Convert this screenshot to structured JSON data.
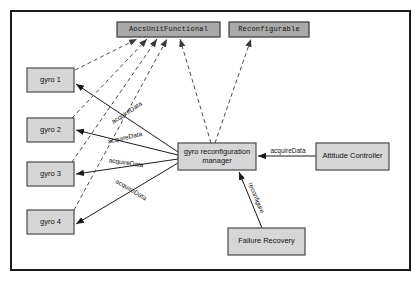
{
  "diagram": {
    "canvas": {
      "width": 419,
      "height": 281
    },
    "frame": {
      "x": 11,
      "y": 11,
      "width": 399,
      "height": 259
    },
    "colors": {
      "background": "#ffffff",
      "frame_stroke": "#1a1a1a",
      "node_fill": "#d6d6d6",
      "node_stroke": "#4a4a4a",
      "interface_fill": "#a9a9a9",
      "interface_stroke": "#3a3a3a",
      "edge_solid": "#1a1a1a",
      "edge_dashed": "#4a4a4a",
      "text": "#111111"
    },
    "nodes": [
      {
        "id": "aocs_unit_functional",
        "label": "AocsUnitFunctional",
        "kind": "interface",
        "x": 117,
        "y": 22,
        "width": 103,
        "height": 15
      },
      {
        "id": "reconfigurable",
        "label": "Reconfigurable",
        "kind": "interface",
        "x": 229,
        "y": 22,
        "width": 80,
        "height": 15
      },
      {
        "id": "gyro_1",
        "label": "gyro 1",
        "kind": "component",
        "x": 27,
        "y": 68,
        "width": 47,
        "height": 24
      },
      {
        "id": "gyro_2",
        "label": "gyro 2",
        "kind": "component",
        "x": 27,
        "y": 118,
        "width": 47,
        "height": 24
      },
      {
        "id": "gyro_3",
        "label": "gyro 3",
        "kind": "component",
        "x": 27,
        "y": 162,
        "width": 47,
        "height": 24
      },
      {
        "id": "gyro_4",
        "label": "gyro 4",
        "kind": "component",
        "x": 27,
        "y": 210,
        "width": 47,
        "height": 24
      },
      {
        "id": "gyro_reconfiguration_manager",
        "label": "gyro reconfiguration manager",
        "label_lines": [
          "gyro reconfiguration",
          "manager"
        ],
        "kind": "component",
        "x": 178,
        "y": 143,
        "width": 78,
        "height": 27
      },
      {
        "id": "attitude_controller",
        "label": "Attitude Controller",
        "kind": "component",
        "x": 316,
        "y": 143,
        "width": 73,
        "height": 27
      },
      {
        "id": "failure_recovery",
        "label": "Failure Recovery",
        "kind": "component",
        "x": 228,
        "y": 228,
        "width": 77,
        "height": 27
      }
    ],
    "edges": [
      {
        "id": "mgr_to_gyro1",
        "from": "gyro_reconfiguration_manager",
        "to": "gyro_1",
        "style": "solid",
        "label": "acquireData",
        "x1": 178,
        "y1": 152,
        "x2": 76,
        "y2": 84,
        "label_x": 127,
        "label_y": 113,
        "label_angle": -33
      },
      {
        "id": "mgr_to_gyro2",
        "from": "gyro_reconfiguration_manager",
        "to": "gyro_2",
        "style": "solid",
        "label": "acquireData",
        "x1": 178,
        "y1": 155,
        "x2": 76,
        "y2": 130,
        "label_x": 125,
        "label_y": 138,
        "label_angle": -13
      },
      {
        "id": "mgr_to_gyro3",
        "from": "gyro_reconfiguration_manager",
        "to": "gyro_3",
        "style": "solid",
        "label": "acquireData",
        "x1": 178,
        "y1": 159,
        "x2": 76,
        "y2": 174,
        "label_x": 126,
        "label_y": 163,
        "label_angle": 8
      },
      {
        "id": "mgr_to_gyro4",
        "from": "gyro_reconfiguration_manager",
        "to": "gyro_4",
        "style": "solid",
        "label": "acquireData",
        "x1": 178,
        "y1": 163,
        "x2": 76,
        "y2": 224,
        "label_x": 131,
        "label_y": 190,
        "label_angle": 31
      },
      {
        "id": "controller_to_mgr",
        "from": "attitude_controller",
        "to": "gyro_reconfiguration_manager",
        "style": "solid",
        "label": "acquireData",
        "x1": 316,
        "y1": 156,
        "x2": 258,
        "y2": 156,
        "label_x": 288,
        "label_y": 151,
        "label_angle": 0
      },
      {
        "id": "recovery_to_mgr",
        "from": "failure_recovery",
        "to": "gyro_reconfiguration_manager",
        "style": "solid",
        "label": "reconfigure",
        "x1": 262,
        "y1": 228,
        "x2": 239,
        "y2": 172,
        "label_x": 256,
        "label_y": 198,
        "label_angle": 68
      },
      {
        "id": "gyro1_realizes_aocs",
        "from": "gyro_1",
        "to": "aocs_unit_functional",
        "style": "dashed",
        "label": "",
        "x1": 75,
        "y1": 70,
        "x2": 137,
        "y2": 39
      },
      {
        "id": "gyro2_realizes_aocs",
        "from": "gyro_2",
        "to": "aocs_unit_functional",
        "style": "dashed",
        "label": "",
        "x1": 72,
        "y1": 118,
        "x2": 147,
        "y2": 39
      },
      {
        "id": "gyro3_realizes_aocs",
        "from": "gyro_3",
        "to": "aocs_unit_functional",
        "style": "dashed",
        "label": "",
        "x1": 72,
        "y1": 162,
        "x2": 157,
        "y2": 39
      },
      {
        "id": "gyro4_realizes_aocs",
        "from": "gyro_4",
        "to": "aocs_unit_functional",
        "style": "dashed",
        "label": "",
        "x1": 74,
        "y1": 210,
        "x2": 167,
        "y2": 39
      },
      {
        "id": "mgr_realizes_aocs",
        "from": "gyro_reconfiguration_manager",
        "to": "aocs_unit_functional",
        "style": "dashed",
        "label": "",
        "x1": 211,
        "y1": 143,
        "x2": 180,
        "y2": 39
      },
      {
        "id": "mgr_realizes_reconfigurable",
        "from": "gyro_reconfiguration_manager",
        "to": "reconfigurable",
        "style": "dashed",
        "label": "",
        "x1": 215,
        "y1": 143,
        "x2": 251,
        "y2": 39
      }
    ]
  }
}
